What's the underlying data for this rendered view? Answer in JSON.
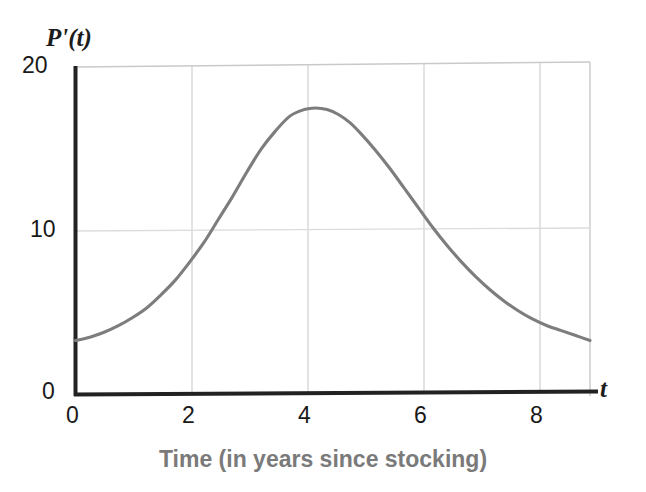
{
  "chart_data": {
    "type": "line",
    "title": "",
    "subtitle": "",
    "xlabel": "Time (in years since stocking)",
    "ylabel": "P'(t)",
    "x_axis_symbol": "t",
    "xlim": [
      0,
      9
    ],
    "ylim": [
      0,
      20
    ],
    "xticks": [
      0,
      2,
      4,
      6,
      8
    ],
    "xtick_labels": [
      "0",
      "2",
      "4",
      "6",
      "8"
    ],
    "yticks": [
      0,
      10,
      20
    ],
    "ytick_labels": [
      "0",
      "10",
      "20"
    ],
    "grid": "vertical gridlines at t=2,4,6,8 and horizontal gridline at P'=10",
    "grid_on": true,
    "legend": null,
    "legend_position": "none",
    "series": [
      {
        "name": "P'(t)",
        "color": "#7d7d7d",
        "x": [
          0.0,
          0.25,
          0.5,
          0.75,
          1.0,
          1.25,
          1.5,
          1.75,
          2.0,
          2.25,
          2.5,
          2.75,
          3.0,
          3.25,
          3.5,
          3.75,
          4.0,
          4.2,
          4.4,
          4.6,
          4.8,
          5.0,
          5.25,
          5.5,
          5.75,
          6.0,
          6.25,
          6.5,
          6.75,
          7.0,
          7.25,
          7.5,
          7.75,
          8.0,
          8.25,
          8.5,
          8.75,
          9.0
        ],
        "y": [
          3.3,
          3.5,
          3.8,
          4.2,
          4.7,
          5.3,
          6.1,
          7.0,
          8.1,
          9.3,
          10.7,
          12.1,
          13.6,
          15.0,
          16.1,
          17.0,
          17.4,
          17.5,
          17.4,
          17.1,
          16.6,
          15.9,
          14.9,
          13.8,
          12.6,
          11.4,
          10.2,
          9.1,
          8.1,
          7.2,
          6.4,
          5.7,
          5.1,
          4.6,
          4.2,
          3.9,
          3.6,
          3.3
        ]
      }
    ],
    "annotations": {
      "peak_value": 17.5,
      "peak_time": 4.2,
      "start_value": 3.3,
      "end_value": 3.3
    }
  },
  "axes": {
    "y_label": "P'(t)",
    "x_label": "t",
    "x_title": "Time (in years since stocking)",
    "y_tick_20": "20",
    "y_tick_10": "10",
    "y_tick_0": "0",
    "x_tick_0": "0",
    "x_tick_2": "2",
    "x_tick_4": "4",
    "x_tick_6": "6",
    "x_tick_8": "8"
  },
  "colors": {
    "curve": "#7d7d7d",
    "axis": "#1c1c1c",
    "grid": "#d9d9d9",
    "plot_border": "#c9c9c9",
    "x_title_text": "#7a7a7a",
    "tick_text": "#191919",
    "background": "#ffffff"
  }
}
